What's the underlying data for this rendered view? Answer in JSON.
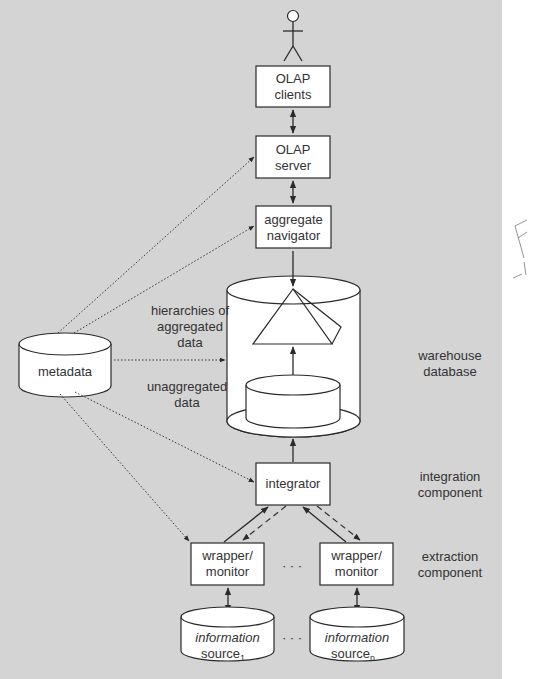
{
  "diagram": {
    "background_color": "#d4d4d4",
    "nodes": {
      "user": {
        "label": "user"
      },
      "olap_clients": {
        "line1": "OLAP",
        "line2": "clients"
      },
      "olap_server": {
        "line1": "OLAP",
        "line2": "server"
      },
      "aggregate_navigator": {
        "line1": "aggregate",
        "line2": "navigator"
      },
      "warehouse": {
        "line1": "warehouse",
        "line2": "database"
      },
      "aggregated_data": {
        "line1": "hierarchies of",
        "line2": "aggregated",
        "line3": "data"
      },
      "unaggregated_data": {
        "line1": "unaggregated",
        "line2": "data"
      },
      "metadata": {
        "label": "metadata"
      },
      "integrator": {
        "label": "integrator"
      },
      "integration_component": {
        "line1": "integration",
        "line2": "component"
      },
      "wrapper_1": {
        "line1": "wrapper/",
        "line2": "monitor"
      },
      "wrapper_n": {
        "line1": "wrapper/",
        "line2": "monitor"
      },
      "extraction_component": {
        "line1": "extraction",
        "line2": "component"
      },
      "source_1": {
        "line1": "information",
        "line2": "source",
        "sub": "1"
      },
      "source_n": {
        "line1": "information",
        "line2": "source",
        "sub": "n"
      }
    },
    "ellipsis": "· · ·",
    "margin_note": "F"
  }
}
